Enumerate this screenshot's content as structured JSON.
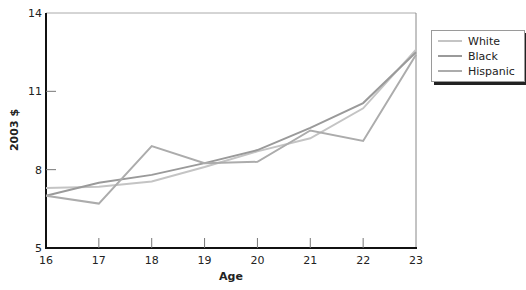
{
  "chart_data": {
    "type": "line",
    "title": "",
    "xlabel": "Age",
    "ylabel": "2003 $",
    "x": [
      16,
      17,
      18,
      19,
      20,
      21,
      22,
      23
    ],
    "xlim": [
      16,
      23
    ],
    "ylim": [
      5,
      14
    ],
    "yticks": [
      5,
      8,
      11,
      14
    ],
    "xticks": [
      16,
      17,
      18,
      19,
      20,
      21,
      22,
      23
    ],
    "grid": false,
    "legend_position": "right",
    "series": [
      {
        "name": "White",
        "color": "#c4c4c4",
        "values": [
          7.3,
          7.35,
          7.55,
          8.1,
          8.7,
          9.2,
          10.35,
          12.6
        ]
      },
      {
        "name": "Black",
        "color": "#9a9a9a",
        "values": [
          7.0,
          7.5,
          7.8,
          8.25,
          8.75,
          9.6,
          10.55,
          12.5
        ]
      },
      {
        "name": "Hispanic",
        "color": "#acacac",
        "values": [
          7.0,
          6.7,
          8.9,
          8.25,
          8.3,
          9.5,
          9.1,
          12.4
        ]
      }
    ]
  },
  "legend": {
    "items": [
      {
        "label": "White",
        "color": "#c4c4c4"
      },
      {
        "label": "Black",
        "color": "#9a9a9a"
      },
      {
        "label": "Hispanic",
        "color": "#acacac"
      }
    ]
  }
}
